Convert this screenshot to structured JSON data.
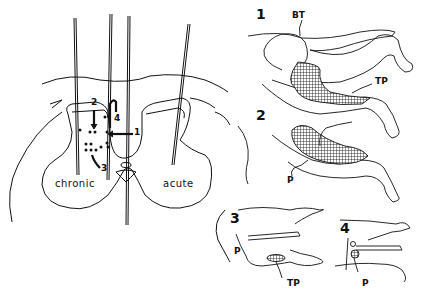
{
  "brain_section": {
    "left_label": "chronic",
    "right_label": "acute",
    "site_labels": [
      "1",
      "2",
      "3",
      "4"
    ]
  },
  "panels": [
    {
      "number": "1",
      "labels": [
        "BT",
        "TP"
      ]
    },
    {
      "number": "2",
      "labels": [
        "P"
      ]
    },
    {
      "number": "3",
      "labels": [
        "P",
        "TP"
      ]
    },
    {
      "number": "4",
      "labels": [
        "P"
      ]
    }
  ],
  "colors": {
    "ink": "#111111",
    "background": "#ffffff"
  }
}
